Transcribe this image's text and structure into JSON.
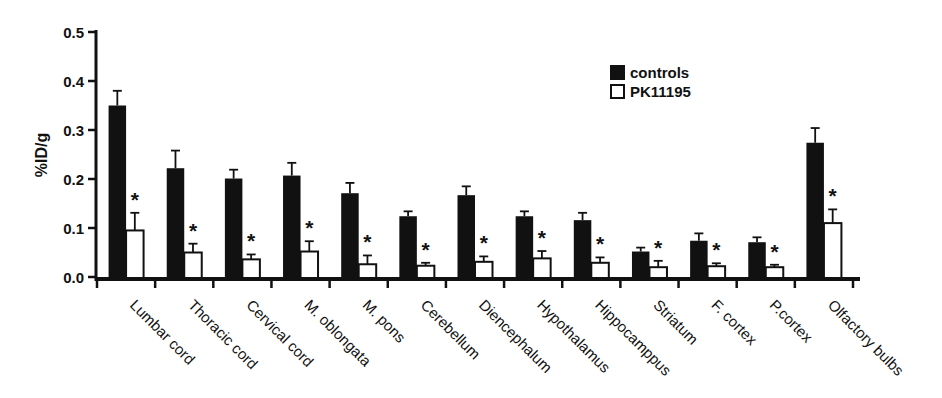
{
  "figure": {
    "background": "#ffffff",
    "bar_fill_controls": "#111111",
    "bar_fill_pk11195": "#ffffff",
    "axis_color": "#111111"
  },
  "chart_data": {
    "type": "bar",
    "title": "",
    "xlabel": "",
    "ylabel": "%ID/g",
    "ylim": [
      0,
      0.5
    ],
    "ytick_step": 0.1,
    "ytick_labels": [
      "0.0",
      "0.1",
      "0.2",
      "0.3",
      "0.4",
      "0.5"
    ],
    "grid": false,
    "significance_marker": "*",
    "legend": {
      "position": "upper-right-inside",
      "entries": [
        {
          "label": "controls",
          "fill": "#111111"
        },
        {
          "label": "PK11195",
          "fill": "#ffffff"
        }
      ]
    },
    "categories": [
      "Lumbar cord",
      "Thoracic cord",
      "Cervical cord",
      "M. oblongata",
      "M. pons",
      "Cerebellum",
      "Diencephalum",
      "Hypothalamus",
      "Hippocamppus",
      "Striatum",
      "F. cortex",
      "P.cortex",
      "Olfactory bulbs"
    ],
    "series": [
      {
        "name": "controls",
        "fill": "#111111",
        "values": [
          0.35,
          0.222,
          0.201,
          0.207,
          0.171,
          0.124,
          0.167,
          0.124,
          0.116,
          0.052,
          0.074,
          0.071,
          0.274
        ],
        "errors": [
          0.03,
          0.036,
          0.018,
          0.026,
          0.021,
          0.01,
          0.018,
          0.01,
          0.015,
          0.008,
          0.015,
          0.01,
          0.03
        ],
        "significant": [
          false,
          false,
          false,
          false,
          false,
          false,
          false,
          false,
          false,
          false,
          false,
          false,
          false
        ]
      },
      {
        "name": "PK11195",
        "fill": "#ffffff",
        "values": [
          0.095,
          0.05,
          0.036,
          0.052,
          0.026,
          0.023,
          0.031,
          0.038,
          0.029,
          0.02,
          0.022,
          0.02,
          0.11
        ],
        "errors": [
          0.036,
          0.018,
          0.01,
          0.021,
          0.018,
          0.006,
          0.011,
          0.015,
          0.011,
          0.013,
          0.006,
          0.005,
          0.028
        ],
        "significant": [
          true,
          true,
          true,
          true,
          true,
          true,
          true,
          true,
          true,
          true,
          true,
          true,
          true
        ]
      }
    ]
  }
}
